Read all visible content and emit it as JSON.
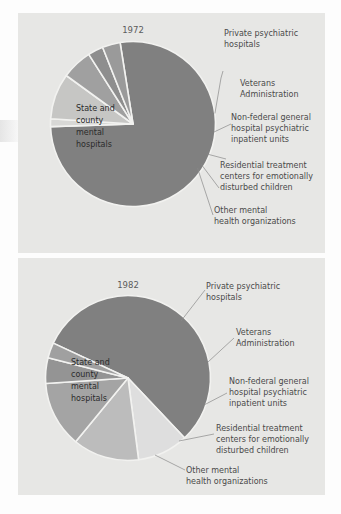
{
  "figure": {
    "background_color": "#fdfdfd",
    "panel_color": "#e7e7e5",
    "slice_stroke_color": "#f2f2f0",
    "leader_color": "#8a8a8a"
  },
  "palette": {
    "dark_gray": "#808080",
    "mid_gray": "#a8a8a8",
    "light_gray": "#d2d2d2",
    "lighter_gray": "#bdbdbd",
    "pale_gray": "#e2e2e0"
  },
  "chart_data": [
    {
      "type": "pie",
      "title": "1972",
      "xlabel": "",
      "ylabel": "",
      "center_label": "State and county mental hospitals",
      "center_label_lines": [
        "State and",
        "county",
        "mental",
        "hospitals"
      ],
      "categories": [
        "State and county mental hospitals",
        "Private psychiatric hospitals",
        "Veterans Administration",
        "Non-federal general hospital psychiatric inpatient units",
        "Residential treatment centers for emotionally disturbed children",
        "Other mental health organizations"
      ],
      "values": [
        77.0,
        1.5,
        9.0,
        6.0,
        3.0,
        3.5
      ],
      "colors": [
        "#808080",
        "#d8d8d6",
        "#c6c6c4",
        "#a0a0a0",
        "#8e8e8e",
        "#9a9a9a"
      ],
      "labels": [
        {
          "text": "Private psychiatric hospitals",
          "lines": [
            "Private psychiatric",
            "hospitals"
          ]
        },
        {
          "text": "Veterans Administration",
          "lines": [
            "Veterans",
            "Administration"
          ]
        },
        {
          "text": "Non-federal general hospital psychiatric inpatient units",
          "lines": [
            "Non-federal general",
            "hospital psychiatric",
            "inpatient units"
          ]
        },
        {
          "text": "Residential treatment centers for emotionally disturbed children",
          "lines": [
            "Residential treatment",
            "centers for emotionally",
            "disturbed children"
          ]
        },
        {
          "text": "Other mental health organizations",
          "lines": [
            "Other mental",
            "health organizations"
          ]
        }
      ],
      "legend_position": "callout-right",
      "grid": false
    },
    {
      "type": "pie",
      "title": "1982",
      "xlabel": "",
      "ylabel": "",
      "center_label": "State and county mental hospitals",
      "center_label_lines": [
        "State and",
        "county",
        "mental",
        "hospitals"
      ],
      "categories": [
        "State and county mental hospitals",
        "Private psychiatric hospitals",
        "Veterans Administration",
        "Non-federal general hospital psychiatric inpatient units",
        "Residential treatment centers for emotionally disturbed children",
        "Other mental health organizations"
      ],
      "values": [
        56.0,
        10.0,
        13.0,
        13.0,
        5.0,
        3.0
      ],
      "colors": [
        "#808080",
        "#dedede",
        "#bcbcbc",
        "#a4a4a4",
        "#949494",
        "#a0a0a0"
      ],
      "labels": [
        {
          "text": "Private psychiatric hospitals",
          "lines": [
            "Private psychiatric",
            "hospitals"
          ]
        },
        {
          "text": "Veterans Administration",
          "lines": [
            "Veterans",
            "Administration"
          ]
        },
        {
          "text": "Non-federal general hospital psychiatric inpatient units",
          "lines": [
            "Non-federal general",
            "hospital psychiatric",
            "inpatient units"
          ]
        },
        {
          "text": "Residential treatment centers for emotionally disturbed children",
          "lines": [
            "Residential treatment",
            "centers for emotionally",
            "disturbed children"
          ]
        },
        {
          "text": "Other mental health organizations",
          "lines": [
            "Other mental",
            "health organizations"
          ]
        }
      ],
      "legend_position": "callout-right",
      "grid": false
    }
  ]
}
